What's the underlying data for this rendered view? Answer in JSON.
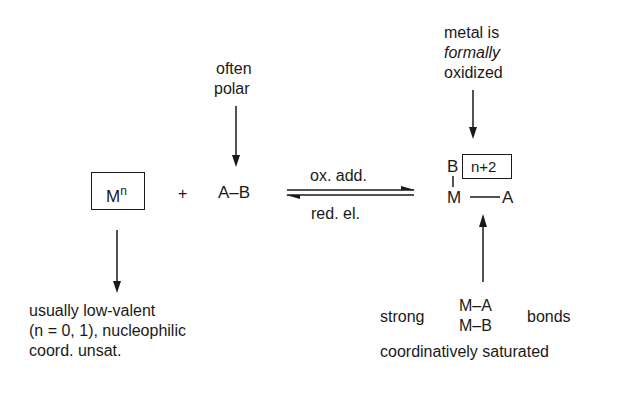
{
  "diagram": {
    "type": "reaction-scheme",
    "reactant_metal": {
      "symbol": "M",
      "superscript": "n"
    },
    "plus": "+",
    "reactant_substrate": "A–B",
    "substrate_note": [
      "often",
      "polar"
    ],
    "forward_label": "ox. add.",
    "reverse_label": "red. el.",
    "product": {
      "top_atom": "B",
      "bond_vertical": "|",
      "oxidation_state": "n+2",
      "bottom_left": "M",
      "bottom_right": "A"
    },
    "product_note_top": [
      "metal is",
      "formally",
      "oxidized"
    ],
    "metal_note": [
      "usually low-valent",
      "(n = 0, 1), nucleophilic",
      "coord. unsat."
    ],
    "product_note_bottom": {
      "prefix": "strong",
      "bonds": [
        "M–A",
        "M–B"
      ],
      "suffix": "bonds",
      "line2": "coordinatively saturated"
    }
  }
}
